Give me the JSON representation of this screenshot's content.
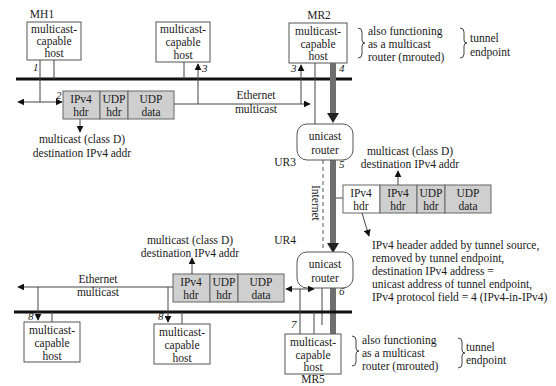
{
  "hosts": {
    "mh1": {
      "name": "MH1",
      "lines": [
        "multicast-",
        "capable",
        "host"
      ]
    },
    "top_middle": {
      "lines": [
        "multicast-",
        "capable",
        "host"
      ]
    },
    "mr2": {
      "name": "MR2",
      "lines": [
        "multicast-",
        "capable",
        "host"
      ]
    },
    "bottom_left": {
      "lines": [
        "multicast-",
        "capable",
        "host"
      ]
    },
    "bottom_middle": {
      "lines": [
        "multicast-",
        "capable",
        "host"
      ]
    },
    "mr5": {
      "name": "MR5",
      "lines": [
        "multicast-",
        "capable",
        "host"
      ]
    }
  },
  "routers": {
    "ur3": {
      "name": "UR3",
      "lines": [
        "unicast",
        "router"
      ]
    },
    "ur4": {
      "name": "UR4",
      "lines": [
        "unicast",
        "router"
      ]
    }
  },
  "annotations": {
    "mr2_role": [
      "also functioning",
      "as a multicast",
      "router ("
    ],
    "mr2_role_cmd": "mrouted",
    "mr2_role_close": ")",
    "mr2_tunnel": [
      "tunnel",
      "endpoint"
    ],
    "mr5_role": [
      "also functioning",
      "as a multicast",
      "router ("
    ],
    "mr5_role_cmd": "mrouted",
    "mr5_role_close": ")",
    "mr5_tunnel": [
      "tunnel",
      "endpoint"
    ],
    "top_ethernet": [
      "Ethernet",
      "multicast"
    ],
    "bottom_ethernet": [
      "Ethernet",
      "multicast"
    ],
    "top_dest": [
      "multicast (class D)",
      "destination IPv4 addr"
    ],
    "tunnel_dest": [
      "multicast (class D)",
      "destination IPv4 addr"
    ],
    "bottom_dest": [
      "multicast (class D)",
      "destination IPv4 addr"
    ],
    "internet": "Internet",
    "tunnel_note": [
      "IPv4 header added by tunnel source,",
      "removed by tunnel endpoint,",
      "destination IPv4 address =",
      "unicast address of tunnel endpoint,",
      "IPv4 protocol field = 4 (IPv4-in-IPv4)"
    ]
  },
  "packets": {
    "top": [
      [
        "IPv4",
        "hdr"
      ],
      [
        "UDP",
        "hdr"
      ],
      [
        "UDP",
        "data"
      ]
    ],
    "tunnel": [
      [
        "IPv4",
        "hdr"
      ],
      [
        "IPv4",
        "hdr"
      ],
      [
        "UDP",
        "hdr"
      ],
      [
        "UDP",
        "data"
      ]
    ],
    "bottom": [
      [
        "IPv4",
        "hdr"
      ],
      [
        "UDP",
        "hdr"
      ],
      [
        "UDP",
        "data"
      ]
    ]
  },
  "steps": [
    "1",
    "2",
    "3",
    "3",
    "4",
    "5",
    "6",
    "7",
    "8",
    "8"
  ],
  "colors": {
    "packet_fill": "#cfcfcf",
    "tunnel_fill": "#6e6e6e",
    "ethernet": "#111111"
  }
}
